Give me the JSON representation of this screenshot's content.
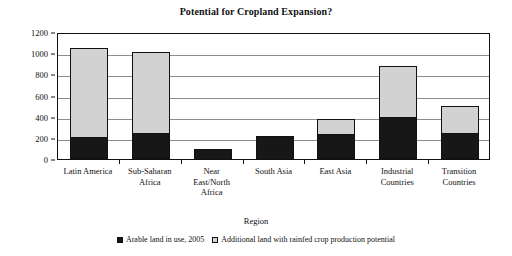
{
  "chart_data": {
    "type": "bar",
    "subtype": "stacked-vertical",
    "title": "Potential for Cropland Expansion?",
    "xlabel": "Region",
    "ylabel": "Million hectares",
    "ylim": [
      0,
      1200
    ],
    "ytick_step": 200,
    "yticks": [
      0,
      200,
      400,
      600,
      800,
      1000,
      1200
    ],
    "ytick_labels": [
      "0",
      "200",
      "400",
      "600",
      "800",
      "1000",
      "1200"
    ],
    "grid": true,
    "legend_position": "bottom",
    "categories": [
      "Latin America",
      "Sub-Saharan\nAfrica",
      "Near\nEast/North\nAfrica",
      "South Asia",
      "East Asia",
      "Industrial\nCountries",
      "Transition\nCountries"
    ],
    "series": [
      {
        "name": "Arable land in use, 2005",
        "color": "#171717",
        "values": [
          205,
          245,
          95,
          215,
          240,
          400,
          245
        ]
      },
      {
        "name": "Additional land with rainfed crop production potential",
        "color": "#d2d2d2",
        "values": [
          845,
          770,
          0,
          0,
          135,
          480,
          255
        ]
      }
    ],
    "totals": [
      1050,
      1015,
      95,
      215,
      375,
      880,
      500
    ]
  },
  "legend": {
    "items": [
      {
        "label": "Arable land in use, 2005",
        "swatch": "dark"
      },
      {
        "label": "Additional land with rainfed crop production potential",
        "swatch": "light"
      }
    ]
  }
}
